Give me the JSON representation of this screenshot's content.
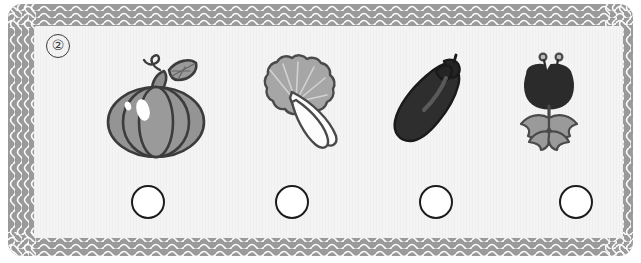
{
  "worksheet": {
    "question_number": "②",
    "border_color": "#9a9a9a",
    "panel_color": "#f4f4f4",
    "wave_line_color": "#ffffff",
    "outline_color": "#3a3a3a",
    "circle_outline_color": "#1c1c1c"
  },
  "items": [
    {
      "name": "pumpkin",
      "label": "Pumpkin",
      "icon": "pumpkin-icon",
      "body_color": "#949494",
      "outline_color": "#3c3c3c",
      "highlight_color": "#ffffff",
      "x": 52
    },
    {
      "name": "bok-choy",
      "label": "Bok choy",
      "icon": "bok-choy-icon",
      "body_color": "#a6a6a6",
      "outline_color": "#4a4a4a",
      "stalk_color": "#fdfdfd",
      "x": 192
    },
    {
      "name": "eggplant",
      "label": "Eggplant",
      "icon": "eggplant-icon",
      "body_color": "#2e2e2e",
      "outline_color": "#1a1a1a",
      "highlight_color": "#5a5a5a",
      "x": 332
    },
    {
      "name": "tulip",
      "label": "Tulip",
      "icon": "tulip-icon",
      "body_color": "#2b2b2b",
      "leaf_color": "#9a9a9a",
      "outline_color": "#4a4a4a",
      "x": 449
    }
  ],
  "answer_circles": [
    {
      "name": "answer-circle-1",
      "value": "",
      "x": 97
    },
    {
      "name": "answer-circle-2",
      "value": "",
      "x": 241
    },
    {
      "name": "answer-circle-3",
      "value": "",
      "x": 385
    },
    {
      "name": "answer-circle-4",
      "value": "",
      "x": 525
    }
  ]
}
